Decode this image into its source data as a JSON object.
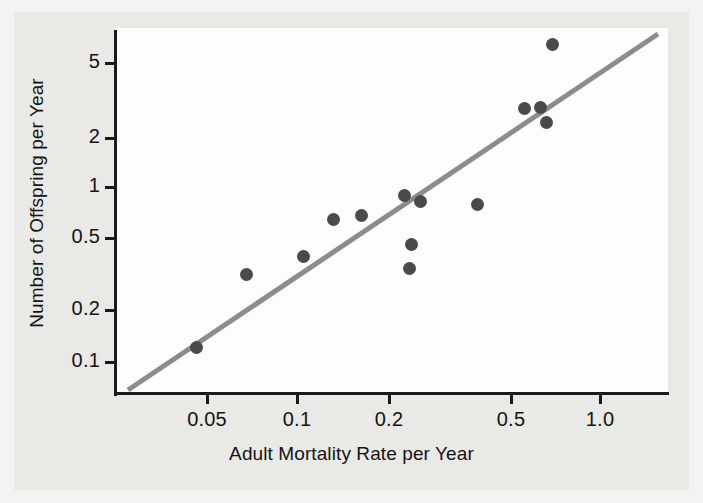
{
  "chart_data": {
    "type": "scatter",
    "title": "",
    "xlabel": "Adult Mortality Rate per Year",
    "ylabel": "Number of Offspring per Year",
    "xscale": "log",
    "yscale": "log",
    "xlim": [
      0.03,
      1.25
    ],
    "ylim": [
      0.1,
      7.0
    ],
    "grid": false,
    "legend": null,
    "xticks": [
      {
        "value": 0.05,
        "label": "0.05",
        "px": 207
      },
      {
        "value": 0.1,
        "label": "0.1",
        "px": 297
      },
      {
        "value": 0.2,
        "label": "0.2",
        "px": 389
      },
      {
        "value": 0.5,
        "label": "0.5",
        "px": 511
      },
      {
        "value": 1.0,
        "label": "1.0",
        "px": 600
      }
    ],
    "yticks": [
      {
        "value": 5,
        "label": "5",
        "px": 63
      },
      {
        "value": 2,
        "label": "2",
        "px": 138
      },
      {
        "value": 1,
        "label": "1",
        "px": 187
      },
      {
        "value": 0.5,
        "label": "0.5",
        "px": 238
      },
      {
        "value": 0.2,
        "label": "0.2",
        "px": 310
      },
      {
        "value": 0.1,
        "label": "0.1",
        "px": 362
      }
    ],
    "points": [
      {
        "x": 0.041,
        "y": 0.175,
        "px": 196,
        "py": 347
      },
      {
        "x": 0.064,
        "y": 0.4,
        "px": 246,
        "py": 274
      },
      {
        "x": 0.112,
        "y": 0.5,
        "px": 303,
        "py": 256
      },
      {
        "x": 0.115,
        "y": 0.79,
        "px": 333,
        "py": 219
      },
      {
        "x": 0.168,
        "y": 0.83,
        "px": 361,
        "py": 215
      },
      {
        "x": 0.193,
        "y": 1.03,
        "px": 404,
        "py": 195
      },
      {
        "x": 0.206,
        "y": 0.95,
        "px": 420,
        "py": 201
      },
      {
        "x": 0.2,
        "y": 0.565,
        "px": 411,
        "py": 244
      },
      {
        "x": 0.198,
        "y": 0.425,
        "px": 409,
        "py": 268
      },
      {
        "x": 0.32,
        "y": 0.93,
        "px": 477,
        "py": 204
      },
      {
        "x": 0.485,
        "y": 2.9,
        "px": 524,
        "py": 108
      },
      {
        "x": 0.545,
        "y": 2.93,
        "px": 540,
        "py": 107
      },
      {
        "x": 0.56,
        "y": 2.47,
        "px": 546,
        "py": 122
      },
      {
        "x": 0.575,
        "y": 6.1,
        "px": 552,
        "py": 44
      }
    ],
    "trend_line": {
      "description": "fitted straight line on log-log axes",
      "from": {
        "px": 128,
        "py": 390
      },
      "to": {
        "px": 658,
        "py": 34
      },
      "color": "#8c8c8c"
    },
    "series_color": "#4a4a4a"
  },
  "axis": {
    "x_title": "Adult Mortality Rate per Year",
    "y_title": "Number of Offspring per Year"
  },
  "colors": {
    "background": "#e9e9e6",
    "canvas": "#fdfdfd",
    "axis": "#1a1a1a",
    "marker": "#4a4a4a",
    "trend": "#8c8c8c"
  }
}
